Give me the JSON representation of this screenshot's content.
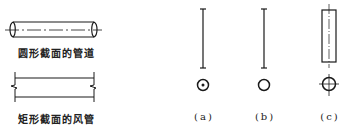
{
  "left_panel": {
    "round_pipe_label": "圆形截面的管道",
    "rect_duct_label": "矩形截面的风管"
  },
  "right_panel": {
    "variants": [
      {
        "id": "a",
        "label": "(a)"
      },
      {
        "id": "b",
        "label": "(b)"
      },
      {
        "id": "c",
        "label": "(c)"
      }
    ]
  },
  "colors": {
    "line": "#1a1a1a",
    "background": "#ffffff"
  }
}
